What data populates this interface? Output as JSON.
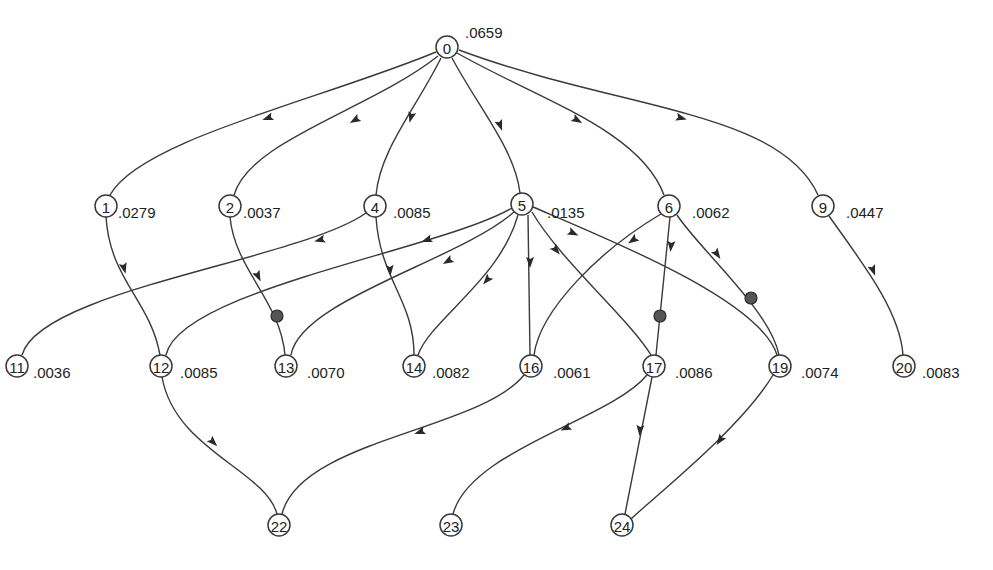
{
  "diagram": {
    "type": "directed-graph",
    "nodes": [
      {
        "id": "0",
        "x": 447,
        "y": 47,
        "weight": ".0659",
        "wx": 465,
        "wy": 32
      },
      {
        "id": "1",
        "x": 106,
        "y": 206,
        "weight": ".0279",
        "wx": 118,
        "wy": 212
      },
      {
        "id": "2",
        "x": 230,
        "y": 206,
        "weight": ".0037",
        "wx": 243,
        "wy": 212
      },
      {
        "id": "4",
        "x": 375,
        "y": 206,
        "weight": ".0085",
        "wx": 393,
        "wy": 212
      },
      {
        "id": "5",
        "x": 522,
        "y": 204,
        "weight": ".0135",
        "wx": 547,
        "wy": 212
      },
      {
        "id": "6",
        "x": 669,
        "y": 206,
        "weight": ".0062",
        "wx": 692,
        "wy": 212
      },
      {
        "id": "9",
        "x": 823,
        "y": 206,
        "weight": ".0447",
        "wx": 846,
        "wy": 212
      },
      {
        "id": "11",
        "x": 17,
        "y": 366,
        "weight": ".0036",
        "wx": 33,
        "wy": 372
      },
      {
        "id": "12",
        "x": 161,
        "y": 366,
        "weight": ".0085",
        "wx": 180,
        "wy": 372
      },
      {
        "id": "13",
        "x": 286,
        "y": 366,
        "weight": ".0070",
        "wx": 307,
        "wy": 372
      },
      {
        "id": "14",
        "x": 414,
        "y": 366,
        "weight": ".0082",
        "wx": 432,
        "wy": 372
      },
      {
        "id": "16",
        "x": 531,
        "y": 366,
        "weight": ".0061",
        "wx": 553,
        "wy": 372
      },
      {
        "id": "17",
        "x": 654,
        "y": 366,
        "weight": ".0086",
        "wx": 675,
        "wy": 372
      },
      {
        "id": "19",
        "x": 780,
        "y": 366,
        "weight": ".0074",
        "wx": 801,
        "wy": 372
      },
      {
        "id": "20",
        "x": 904,
        "y": 366,
        "weight": ".0083",
        "wx": 922,
        "wy": 372
      },
      {
        "id": "22",
        "x": 279,
        "y": 525,
        "weight": "",
        "wx": 0,
        "wy": 0
      },
      {
        "id": "23",
        "x": 451,
        "y": 525,
        "weight": "",
        "wx": 0,
        "wy": 0
      },
      {
        "id": "24",
        "x": 622,
        "y": 525,
        "weight": "",
        "wx": 0,
        "wy": 0
      }
    ],
    "edges": [
      {
        "from": "0",
        "to": "1",
        "d": "M436,52 C320,100 140,140 110,195"
      },
      {
        "from": "0",
        "to": "2",
        "d": "M438,56 C370,110 250,140 234,195"
      },
      {
        "from": "0",
        "to": "4",
        "d": "M441,58 C415,110 380,150 376,195"
      },
      {
        "from": "0",
        "to": "5",
        "d": "M452,58 C480,110 515,150 520,193"
      },
      {
        "from": "0",
        "to": "6",
        "d": "M457,53 C540,100 640,130 664,195"
      },
      {
        "from": "0",
        "to": "9",
        "d": "M459,50 C620,110 780,110 818,195"
      },
      {
        "from": "1",
        "to": "12",
        "d": "M106,217 C110,280 150,300 160,355"
      },
      {
        "from": "2",
        "to": "13",
        "d": "M230,217 C235,270 280,300 285,355"
      },
      {
        "from": "4",
        "to": "11",
        "d": "M366,213 C300,260 40,290 22,355"
      },
      {
        "from": "4",
        "to": "14",
        "d": "M376,217 C380,280 414,300 414,355"
      },
      {
        "from": "5",
        "to": "12",
        "d": "M512,208 C440,250 180,290 166,355"
      },
      {
        "from": "5",
        "to": "13",
        "d": "M514,212 C460,260 300,300 291,355"
      },
      {
        "from": "5",
        "to": "14",
        "d": "M518,215 C500,280 430,320 418,355"
      },
      {
        "from": "5",
        "to": "16",
        "d": "M528,215 L530,355"
      },
      {
        "from": "5",
        "to": "17",
        "d": "M532,212 C560,260 630,320 651,355"
      },
      {
        "from": "5",
        "to": "19",
        "d": "M533,207 C610,240 760,300 777,355"
      },
      {
        "from": "6",
        "to": "16",
        "d": "M661,214 C600,250 540,310 534,355"
      },
      {
        "from": "6",
        "to": "17",
        "d": "M670,217 L656,355"
      },
      {
        "from": "6",
        "to": "19",
        "d": "M677,215 C700,250 770,310 779,355"
      },
      {
        "from": "9",
        "to": "20",
        "d": "M829,216 C860,260 900,310 903,355"
      },
      {
        "from": "12",
        "to": "22",
        "d": "M162,377 C175,450 265,470 277,514"
      },
      {
        "from": "16",
        "to": "22",
        "d": "M524,375 C480,430 300,440 282,514"
      },
      {
        "from": "17",
        "to": "23",
        "d": "M647,375 C610,420 470,450 453,514"
      },
      {
        "from": "17",
        "to": "24",
        "d": "M652,377 L625,514"
      },
      {
        "from": "19",
        "to": "24",
        "d": "M773,375 C740,430 650,500 630,520"
      }
    ],
    "arrows": [
      {
        "x": 268,
        "y": 118,
        "angle": 160
      },
      {
        "x": 355,
        "y": 120,
        "angle": 150
      },
      {
        "x": 411,
        "y": 117,
        "angle": 105
      },
      {
        "x": 500,
        "y": 125,
        "angle": 70
      },
      {
        "x": 577,
        "y": 120,
        "angle": 30
      },
      {
        "x": 681,
        "y": 118,
        "angle": 15
      },
      {
        "x": 124,
        "y": 268,
        "angle": 75
      },
      {
        "x": 258,
        "y": 276,
        "angle": 65
      },
      {
        "x": 320,
        "y": 240,
        "angle": 165
      },
      {
        "x": 390,
        "y": 270,
        "angle": 85
      },
      {
        "x": 427,
        "y": 240,
        "angle": 160
      },
      {
        "x": 448,
        "y": 261,
        "angle": 150
      },
      {
        "x": 487,
        "y": 280,
        "angle": 130
      },
      {
        "x": 530,
        "y": 262,
        "angle": 90
      },
      {
        "x": 556,
        "y": 250,
        "angle": 50
      },
      {
        "x": 573,
        "y": 233,
        "angle": 25
      },
      {
        "x": 633,
        "y": 240,
        "angle": 145
      },
      {
        "x": 671,
        "y": 246,
        "angle": 95
      },
      {
        "x": 717,
        "y": 254,
        "angle": 55
      },
      {
        "x": 873,
        "y": 270,
        "angle": 70
      },
      {
        "x": 213,
        "y": 442,
        "angle": 45
      },
      {
        "x": 420,
        "y": 432,
        "angle": 160
      },
      {
        "x": 566,
        "y": 428,
        "angle": 155
      },
      {
        "x": 640,
        "y": 430,
        "angle": 95
      },
      {
        "x": 720,
        "y": 440,
        "angle": 125
      }
    ],
    "markers": [
      {
        "x": 277,
        "y": 316,
        "label": "filled-marker"
      },
      {
        "x": 660,
        "y": 316,
        "label": "filled-marker"
      },
      {
        "x": 751,
        "y": 298,
        "label": "filled-marker"
      }
    ]
  }
}
